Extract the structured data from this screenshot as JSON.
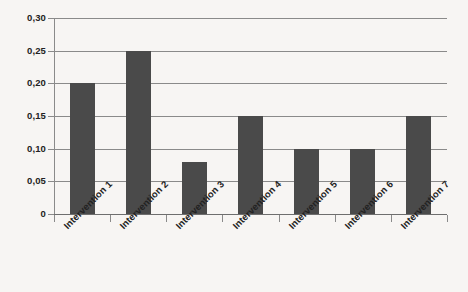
{
  "chart_data": {
    "type": "bar",
    "title": "",
    "subtitle": "",
    "xlabel": "",
    "ylabel": "",
    "categories": [
      "Intervention 1",
      "Intervention 2",
      "Intervention 3",
      "Intervention 4",
      "Intervention 5",
      "Intervention 6",
      "Intervention 7"
    ],
    "values": [
      0.2,
      0.25,
      0.08,
      0.15,
      0.1,
      0.1,
      0.15
    ],
    "ylim": [
      0,
      0.3
    ],
    "ytick_values": [
      0.3,
      0.25,
      0.2,
      0.15,
      0.1,
      0.05,
      0
    ],
    "ytick_labels": [
      "0,30",
      "0,25",
      "0,20",
      "0,15",
      "0,10",
      "0,05",
      "0"
    ],
    "grid": true,
    "grid_axis": "y",
    "legend": false,
    "legend_position": "none",
    "decimal_separator": ",",
    "xtick_label_rotation": -45,
    "bar_color": "#4a4a4a",
    "gridline_color": "#8a8a8a",
    "axis_color": "#8a8a8a",
    "background_color": "#f7f5f3",
    "text_color": "#222222"
  }
}
